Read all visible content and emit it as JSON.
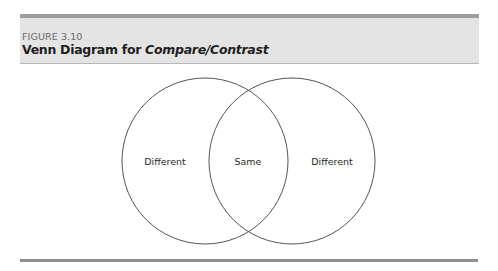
{
  "figure": {
    "label": "FIGURE 3.10",
    "title_prefix": "Venn Diagram for ",
    "title_emphasis": "Compare/Contrast"
  },
  "venn": {
    "left_label": "Different",
    "center_label": "Same",
    "right_label": "Different",
    "circles": [
      {
        "name": "left",
        "cx": 205,
        "cy": 161,
        "r": 83
      },
      {
        "name": "right",
        "cx": 292,
        "cy": 161,
        "r": 83
      }
    ],
    "stroke_color": "#555555"
  },
  "colors": {
    "header_bg": "#e4e4e4",
    "header_rule": "#9d9d9d",
    "bottom_rule": "#8f8f8f"
  }
}
